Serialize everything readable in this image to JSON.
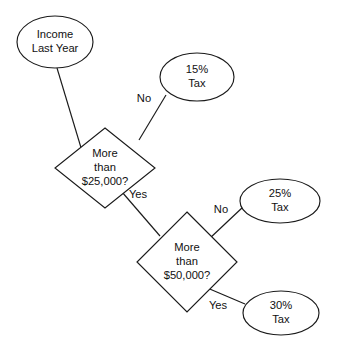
{
  "diagram": {
    "type": "decision-tree-flowchart",
    "canvas": {
      "width": 342,
      "height": 356,
      "background": "#ffffff"
    },
    "stroke_color": "#1a1a1a",
    "text_color": "#111111",
    "nodes": [
      {
        "id": "start",
        "shape": "ellipse",
        "role": "start",
        "line1": "Income",
        "line2": "Last Year",
        "cx": 55,
        "cy": 42,
        "rx": 38,
        "ry": 26
      },
      {
        "id": "decision1",
        "shape": "diamond",
        "role": "decision",
        "line1": "More",
        "line2": "than",
        "line3": "$25,000?",
        "cx": 105,
        "cy": 168,
        "rx": 50,
        "ry": 40
      },
      {
        "id": "decision2",
        "shape": "diamond",
        "role": "decision",
        "line1": "More",
        "line2": "than",
        "line3": "$50,000?",
        "cx": 187,
        "cy": 262,
        "rx": 50,
        "ry": 50
      },
      {
        "id": "tax15",
        "shape": "ellipse",
        "role": "outcome",
        "line1": "15%",
        "line2": "Tax",
        "cx": 197,
        "cy": 77,
        "rx": 37,
        "ry": 24
      },
      {
        "id": "tax25",
        "shape": "ellipse",
        "role": "outcome",
        "line1": "25%",
        "line2": "Tax",
        "cx": 280,
        "cy": 201,
        "rx": 40,
        "ry": 22
      },
      {
        "id": "tax30",
        "shape": "ellipse",
        "role": "outcome",
        "line1": "30%",
        "line2": "Tax",
        "cx": 281,
        "cy": 313,
        "rx": 38,
        "ry": 22
      }
    ],
    "edges": [
      {
        "id": "edge-start-decision1",
        "from": "start",
        "to": "decision1",
        "label": "",
        "path": "M 57 68 L 82 151"
      },
      {
        "id": "edge-decision1-no",
        "from": "decision1",
        "to": "tax15",
        "label": "No",
        "label_x": 144,
        "label_y": 99,
        "path": "M 139 140 L 166 95"
      },
      {
        "id": "edge-decision1-yes",
        "from": "decision1",
        "to": "decision2",
        "label": "Yes",
        "label_x": 138,
        "label_y": 195,
        "path": "M 122 192 L 160 236"
      },
      {
        "id": "edge-decision2-no",
        "from": "decision2",
        "to": "tax25",
        "label": "No",
        "label_x": 221,
        "label_y": 210,
        "path": "M 209 239 L 243 207"
      },
      {
        "id": "edge-decision2-yes",
        "from": "decision2",
        "to": "tax30",
        "label": "Yes",
        "label_x": 218,
        "label_y": 306,
        "path": "M 205 287 L 245 304"
      }
    ]
  }
}
